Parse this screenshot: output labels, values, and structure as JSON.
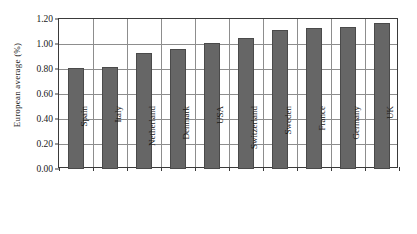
{
  "chart_data": {
    "type": "bar",
    "title": "",
    "xlabel": "",
    "ylabel": "European average (%)",
    "categories": [
      "Spain",
      "Italy",
      "Netherland",
      "Denmark",
      "USA",
      "Switzerland",
      "Sweden",
      "France",
      "Germany",
      "UK"
    ],
    "values": [
      0.81,
      0.82,
      0.93,
      0.96,
      1.01,
      1.05,
      1.11,
      1.13,
      1.14,
      1.17
    ],
    "ylim": [
      0.0,
      1.2
    ],
    "ytick_values": [
      0.0,
      0.2,
      0.4,
      0.6,
      0.8,
      1.0,
      1.2
    ],
    "ytick_labels": [
      "0.00",
      "0.20",
      "0.40",
      "0.60",
      "0.80",
      "1.00",
      "1.20"
    ],
    "grid": "horizontal-and-vertical",
    "legend": "none",
    "bar_color": "#666666",
    "bar_edge_color": "#4a4a4a",
    "grid_color": "#8d8d8d",
    "axis_color": "#3a3a3a",
    "background_color": "#ffffff"
  }
}
